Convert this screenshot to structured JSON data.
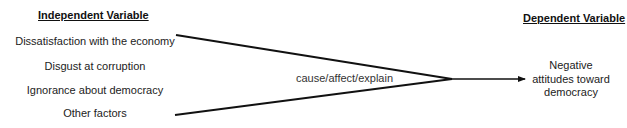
{
  "independent": {
    "heading": "Independent Variable",
    "items": [
      "Dissatisfaction with the economy",
      "Disgust at corruption",
      "Ignorance about democracy",
      "Other factors"
    ]
  },
  "connector": {
    "label": "cause/affect/explain"
  },
  "dependent": {
    "heading": "Dependent Variable",
    "lines": [
      "Negative",
      "attitudes toward",
      "democracy"
    ]
  },
  "colors": {
    "line": "#111111",
    "text": "#222222",
    "background": "#ffffff"
  }
}
